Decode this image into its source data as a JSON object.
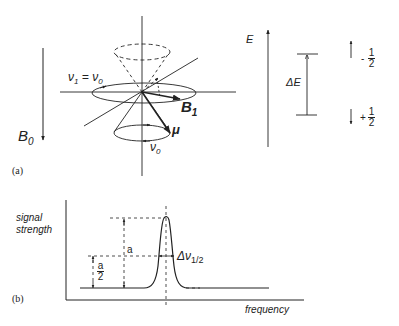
{
  "panel_a": {
    "caption": "(a)",
    "b0_label": "B",
    "b0_sub": "0",
    "nu1_label": "ν",
    "nu1_sub": "1",
    "nu1_eq": " = ν",
    "nu1_eq_sub": "0",
    "b1_label": "B",
    "b1_sub": "1",
    "mu_label": "μ",
    "nu0_label": "ν",
    "nu0_sub": "0",
    "energy_axis_label": "E",
    "delta_e_label": "ΔE",
    "upper_state": {
      "sign": "-",
      "num": "1",
      "den": "2"
    },
    "lower_state": {
      "sign": "+",
      "num": "1",
      "den": "2"
    }
  },
  "panel_b": {
    "caption": "(b)",
    "ylabel_line1": "signal",
    "ylabel_line2": "strength",
    "xlabel": "frequency",
    "height_label": "a",
    "half_height": {
      "num": "a",
      "den": "2"
    },
    "width_label": "Δν",
    "width_sub": "1/2"
  }
}
